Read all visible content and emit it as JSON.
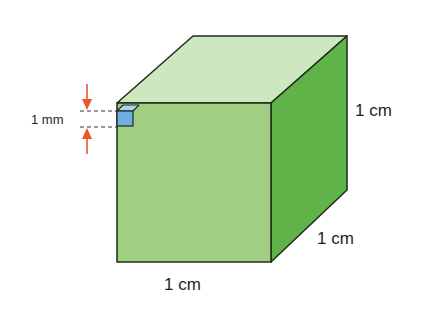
{
  "diagram": {
    "labels": {
      "height": "1 cm",
      "depth": "1 cm",
      "width": "1 cm",
      "small_cube": "1 mm"
    },
    "colors": {
      "front_face": "#a1cf82",
      "top_face": "#cde7c0",
      "side_face": "#5fb348",
      "small_cube_front": "#6fb0e0",
      "small_cube_top": "#a9d3ef",
      "arrow": "#e8562a",
      "edge": "#1e2a1a"
    }
  }
}
